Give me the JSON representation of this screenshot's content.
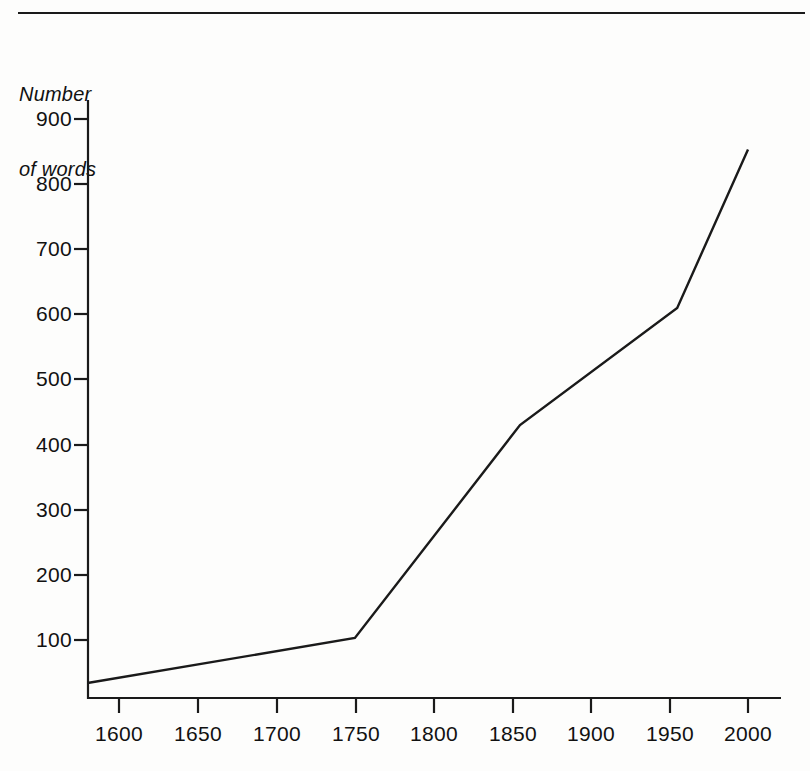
{
  "figure": {
    "rule_color": "#1a1a1a",
    "background": "#fdfdfc",
    "line_color": "#1a1a1a",
    "axis_color": "#1a1a1a"
  },
  "chart_data": {
    "type": "line",
    "title": "",
    "subtitle": "",
    "ylabel_lines": [
      "Number",
      "of words"
    ],
    "ylabel": "Number of words",
    "xlabel": "",
    "x": [
      1580,
      1750,
      1855,
      1955,
      2000
    ],
    "values": [
      34,
      103,
      430,
      610,
      853
    ],
    "series": [
      {
        "name": "Number of words",
        "x": [
          1580,
          1750,
          1855,
          1955,
          2000
        ],
        "values": [
          34,
          103,
          430,
          610,
          853
        ]
      }
    ],
    "xlim": [
      1580,
      2015
    ],
    "ylim": [
      0,
      935
    ],
    "xticks": [
      1600,
      1650,
      1700,
      1750,
      1800,
      1850,
      1900,
      1950,
      2000
    ],
    "xtick_labels": [
      "1600",
      "1650",
      "1700",
      "1750",
      "1800",
      "1850",
      "1900",
      "1950",
      "2000"
    ],
    "yticks": [
      100,
      200,
      300,
      400,
      500,
      600,
      700,
      800,
      900
    ],
    "ytick_labels": [
      "100",
      "200",
      "300",
      "400",
      "500",
      "600",
      "700",
      "800",
      "900"
    ],
    "grid": false,
    "legend": null,
    "legend_position": "none",
    "annotations": []
  }
}
